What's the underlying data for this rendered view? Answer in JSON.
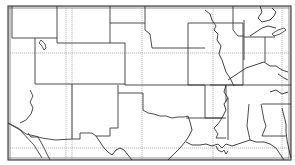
{
  "map": {
    "type": "outline-map",
    "region": "South-central and southwestern United States",
    "style": "black-and-white line map with state boundaries, dashed graticule and tick-marked neatline",
    "colors": {
      "background": "#ffffff",
      "lines": "#3a3a3a",
      "graticule": "#8a8a8a",
      "frame": "#222222"
    },
    "labels": []
  }
}
